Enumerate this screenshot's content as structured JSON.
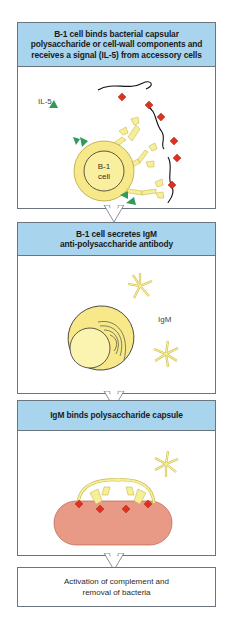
{
  "panels": [
    {
      "header": "B-1 cell binds bacterial capsular polysaccharide or cell-wall components and receives a signal (IL-5) from accessory cells",
      "header_lines": [
        "B-1 cell binds bacterial capsular",
        "polysaccharide or cell-wall components and",
        "receives a signal (IL-5) from accessory cells"
      ],
      "labels": {
        "il5": "IL-5",
        "cell_line1": "B-1",
        "cell_line2": "cell"
      }
    },
    {
      "header": "B-1 cell secretes IgM anti-polysaccharide antibody",
      "header_lines": [
        "B-1 cell secretes IgM",
        "anti-polysaccharide antibody"
      ],
      "labels": {
        "igm": "IgM"
      }
    },
    {
      "header": "IgM binds polysaccharide capsule",
      "header_lines": [
        "IgM binds polysaccharide capsule"
      ]
    },
    {
      "text_lines": [
        "Activation of complement and",
        "removal of bacteria"
      ]
    }
  ],
  "colors": {
    "header_blue": "#a9d4ee",
    "cell_yellow": "#f7e98a",
    "antibody_yellow": "#f6ef9a",
    "antigen_red": "#e0301e",
    "il5_green": "#2f9a5a",
    "bacterium_pink": "#e99a86",
    "border": "#6b7580"
  }
}
